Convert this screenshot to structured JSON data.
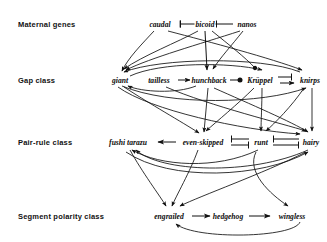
{
  "figure": {
    "type": "diagram",
    "width": 327,
    "height": 242,
    "background": "#ffffff",
    "ink_color": "#111111"
  },
  "rows": [
    {
      "id": "maternal",
      "label": "Maternal genes",
      "label_x": 18,
      "y": 24
    },
    {
      "id": "gap",
      "label": "Gap class",
      "label_x": 18,
      "y": 80
    },
    {
      "id": "pair_rule",
      "label": "Pair-rule class",
      "label_x": 18,
      "y": 142
    },
    {
      "id": "segment_polarity",
      "label": "Segment polarity class",
      "label_x": 18,
      "y": 216
    }
  ],
  "nodes": [
    {
      "id": "caudal",
      "label": "caudal",
      "row": "maternal",
      "x": 160,
      "y": 24
    },
    {
      "id": "bicoid",
      "label": "bicoid",
      "row": "maternal",
      "x": 205,
      "y": 24
    },
    {
      "id": "nanos",
      "label": "nanos",
      "row": "maternal",
      "x": 247,
      "y": 24
    },
    {
      "id": "giant",
      "label": "giant",
      "row": "gap",
      "x": 120,
      "y": 80
    },
    {
      "id": "tailless",
      "label": "tailless",
      "row": "gap",
      "x": 159,
      "y": 80
    },
    {
      "id": "hunchback",
      "label": "hunchback",
      "row": "gap",
      "x": 209,
      "y": 80
    },
    {
      "id": "kruppel",
      "label": "Krüppel",
      "row": "gap",
      "x": 260,
      "y": 80
    },
    {
      "id": "knirps",
      "label": "knirps",
      "row": "gap",
      "x": 310,
      "y": 80
    },
    {
      "id": "fushi_tarazu",
      "label": "fushi tarazu",
      "row": "pair_rule",
      "x": 128,
      "y": 142
    },
    {
      "id": "even_skipped",
      "label": "even-skipped",
      "row": "pair_rule",
      "x": 203,
      "y": 142
    },
    {
      "id": "runt",
      "label": "runt",
      "row": "pair_rule",
      "x": 261,
      "y": 142
    },
    {
      "id": "hairy",
      "label": "hairy",
      "row": "pair_rule",
      "x": 311,
      "y": 142
    },
    {
      "id": "engrailed",
      "label": "engrailed",
      "row": "segment_polarity",
      "x": 169,
      "y": 216
    },
    {
      "id": "hedgehog",
      "label": "hedgehog",
      "row": "segment_polarity",
      "x": 228,
      "y": 216
    },
    {
      "id": "wingless",
      "label": "wingless",
      "row": "segment_polarity",
      "x": 292,
      "y": 216
    }
  ],
  "edge_types": {
    "arrow": "activation (pointed arrowhead)",
    "bar": "repression (T-bar)",
    "ball": "repression (filled circle)"
  },
  "edges": [
    {
      "from": "bicoid",
      "to": "caudal",
      "type": "bar"
    },
    {
      "from": "bicoid",
      "to": "nanos",
      "type": "bar"
    },
    {
      "from": "caudal",
      "to": "giant",
      "type": "arrow"
    },
    {
      "from": "caudal",
      "to": "knirps",
      "type": "arrow"
    },
    {
      "from": "bicoid",
      "to": "giant",
      "type": "arrow"
    },
    {
      "from": "bicoid",
      "to": "hunchback",
      "type": "arrow"
    },
    {
      "from": "bicoid",
      "to": "kruppel",
      "type": "ball"
    },
    {
      "from": "nanos",
      "to": "hunchback",
      "type": "arrow"
    },
    {
      "from": "nanos",
      "to": "giant",
      "type": "arrow"
    },
    {
      "from": "tailless",
      "to": "hunchback",
      "type": "arrow"
    },
    {
      "from": "hunchback",
      "to": "kruppel",
      "type": "ball"
    },
    {
      "from": "kruppel",
      "to": "knirps",
      "type": "bar"
    },
    {
      "from": "knirps",
      "to": "kruppel",
      "type": "arrow"
    },
    {
      "from": "hunchback",
      "to": "giant",
      "type": "arrow"
    },
    {
      "from": "knirps",
      "to": "giant",
      "type": "arrow"
    },
    {
      "from": "giant",
      "to": "knirps",
      "type": "arrow"
    },
    {
      "from": "giant",
      "to": "hairy",
      "type": "arrow"
    },
    {
      "from": "hunchback",
      "to": "even_skipped",
      "type": "arrow"
    },
    {
      "from": "hunchback",
      "to": "hairy",
      "type": "arrow"
    },
    {
      "from": "kruppel",
      "to": "even_skipped",
      "type": "arrow"
    },
    {
      "from": "kruppel",
      "to": "runt",
      "type": "arrow"
    },
    {
      "from": "knirps",
      "to": "runt",
      "type": "arrow"
    },
    {
      "from": "knirps",
      "to": "hairy",
      "type": "arrow"
    },
    {
      "from": "giant",
      "to": "even_skipped",
      "type": "arrow"
    },
    {
      "from": "tailless",
      "to": "hairy",
      "type": "arrow"
    },
    {
      "from": "even_skipped",
      "to": "fushi_tarazu",
      "type": "arrow"
    },
    {
      "from": "even_skipped",
      "to": "runt",
      "type": "bar"
    },
    {
      "from": "runt",
      "to": "even_skipped",
      "type": "bar"
    },
    {
      "from": "runt",
      "to": "hairy",
      "type": "bar"
    },
    {
      "from": "hairy",
      "to": "runt",
      "type": "bar"
    },
    {
      "from": "hairy",
      "to": "fushi_tarazu",
      "type": "arrow"
    },
    {
      "from": "runt",
      "to": "fushi_tarazu",
      "type": "arrow"
    },
    {
      "from": "fushi_tarazu",
      "to": "engrailed",
      "type": "arrow"
    },
    {
      "from": "even_skipped",
      "to": "engrailed",
      "type": "arrow"
    },
    {
      "from": "runt",
      "to": "wingless",
      "type": "arrow"
    },
    {
      "from": "hairy",
      "to": "engrailed",
      "type": "arrow"
    },
    {
      "from": "engrailed",
      "to": "hedgehog",
      "type": "arrow"
    },
    {
      "from": "hedgehog",
      "to": "wingless",
      "type": "arrow"
    },
    {
      "from": "wingless",
      "to": "engrailed",
      "type": "arrow"
    }
  ]
}
